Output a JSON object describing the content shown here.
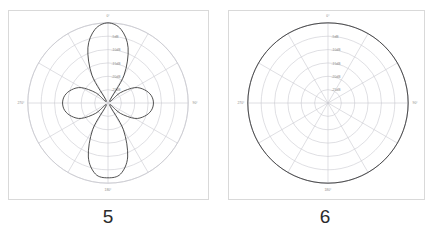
{
  "figure": {
    "background_color": "#ffffff",
    "panel_border_color": "#d9d9d9",
    "grid_color": "#c9c9cf",
    "trace_color": "#3a3a3a",
    "label_color": "#8a8a8a",
    "caption_color": "#2b2b2b"
  },
  "panels": [
    {
      "id": "panel-left",
      "caption": "5",
      "chart_data": {
        "type": "line",
        "plot_kind": "polar-radiation-pattern",
        "title": "",
        "xlabel": "",
        "ylabel": "",
        "grid": true,
        "legend": "none",
        "angle_unit": "degrees",
        "angle_labels": [
          "0°",
          "90°",
          "180°",
          "270°"
        ],
        "angle_label_positions_deg": [
          0,
          90,
          180,
          270
        ],
        "spoke_count": 12,
        "spoke_step_deg": 30,
        "ring_count": 6,
        "radial_ticks_db": [
          -5,
          -10,
          -15,
          -20,
          -25
        ],
        "radial_tick_labels": [
          "-5dB",
          "-10dB",
          "-15dB",
          "-20dB",
          "-25dB"
        ],
        "rlim_db": [
          -30,
          0
        ],
        "outer_ring_db": 0,
        "lobes": [
          {
            "name": "main-lobe-up",
            "center_deg": 0,
            "peak_db": 0,
            "beamwidth_deg": 34
          },
          {
            "name": "main-lobe-down",
            "center_deg": 180,
            "peak_db": -2,
            "beamwidth_deg": 34
          },
          {
            "name": "side-lobe-left",
            "center_deg": 270,
            "peak_db": -13,
            "beamwidth_deg": 26
          },
          {
            "name": "side-lobe-right",
            "center_deg": 90,
            "peak_db": -13,
            "beamwidth_deg": 26
          }
        ],
        "series": [
          {
            "name": "pattern-5",
            "theta_deg": [
              0,
              10,
              20,
              30,
              40,
              50,
              60,
              70,
              80,
              90,
              100,
              110,
              120,
              130,
              140,
              150,
              160,
              170,
              180,
              190,
              200,
              210,
              220,
              230,
              240,
              250,
              260,
              270,
              280,
              290,
              300,
              310,
              320,
              330,
              340,
              350,
              360
            ],
            "values_db": [
              0,
              -2.0,
              -8.0,
              -18.0,
              -29.0,
              -24.0,
              -18.5,
              -15.5,
              -13.6,
              -13.0,
              -13.6,
              -15.5,
              -18.5,
              -24.0,
              -29.0,
              -18.5,
              -8.5,
              -3.0,
              -2.0,
              -3.0,
              -8.5,
              -18.5,
              -29.0,
              -24.0,
              -18.5,
              -15.5,
              -13.6,
              -13.0,
              -13.6,
              -15.5,
              -18.5,
              -24.0,
              -29.0,
              -18.0,
              -8.0,
              -2.0,
              0
            ]
          }
        ]
      }
    },
    {
      "id": "panel-right",
      "caption": "6",
      "chart_data": {
        "type": "line",
        "plot_kind": "polar-radiation-pattern",
        "title": "",
        "xlabel": "",
        "ylabel": "",
        "grid": true,
        "legend": "none",
        "angle_unit": "degrees",
        "angle_labels": [
          "0°",
          "90°",
          "180°",
          "270°"
        ],
        "angle_label_positions_deg": [
          0,
          90,
          180,
          270
        ],
        "spoke_count": 12,
        "spoke_step_deg": 30,
        "ring_count": 6,
        "radial_ticks_db": [
          -5,
          -10,
          -15,
          -20,
          -25
        ],
        "radial_tick_labels": [
          "-5dB",
          "-10dB",
          "-15dB",
          "-20dB",
          "-25dB"
        ],
        "rlim_db": [
          -30,
          0
        ],
        "outer_ring_db": 0,
        "lobes": [
          {
            "name": "omnidirectional",
            "center_deg": 0,
            "peak_db": 0,
            "beamwidth_deg": 360
          }
        ],
        "series": [
          {
            "name": "pattern-6",
            "theta_deg": [
              0,
              10,
              20,
              30,
              40,
              50,
              60,
              70,
              80,
              90,
              100,
              110,
              120,
              130,
              140,
              150,
              160,
              170,
              180,
              190,
              200,
              210,
              220,
              230,
              240,
              250,
              260,
              270,
              280,
              290,
              300,
              310,
              320,
              330,
              340,
              350,
              360
            ],
            "values_db": [
              0,
              0,
              0,
              0,
              0,
              0,
              0,
              0,
              0,
              0,
              0,
              0,
              0,
              0,
              0,
              0,
              0,
              0,
              0,
              0,
              0,
              0,
              0,
              0,
              0,
              0,
              0,
              0,
              0,
              0,
              0,
              0,
              0,
              0,
              0,
              0,
              0
            ]
          }
        ]
      }
    }
  ]
}
